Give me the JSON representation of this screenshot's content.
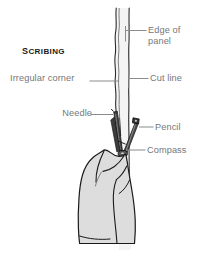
{
  "figure": {
    "title": "Scribing",
    "background_color": "#ffffff",
    "label_color": "#76777a",
    "line_color": "#8a8b8e",
    "ink_color": "#1a1a1a",
    "hand_fill": "#dcdcdc",
    "panel_fill": "#f2f2f2"
  },
  "labels": {
    "edge_of_panel": "Edge of\npanel",
    "cut_line": "Cut line",
    "pencil": "Pencil",
    "compass": "Compass",
    "irregular_corner": "Irregular corner",
    "needle": "Needle"
  }
}
